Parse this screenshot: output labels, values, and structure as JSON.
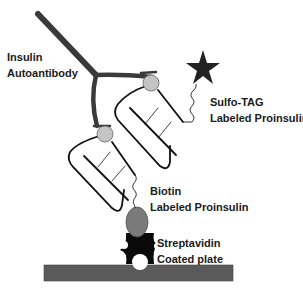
{
  "diagram": {
    "type": "assay schematic",
    "labels": {
      "antibody": {
        "line1": "Insulin",
        "line2": "Autoantibody"
      },
      "sulfotag": {
        "line1": "Sulfo-TAG",
        "line2": "Labeled Proinsulin"
      },
      "biotin": {
        "line1": "Biotin",
        "line2": "Labeled Proinsulin"
      },
      "streptavidin": {
        "line1": "Streptavidin",
        "line2": "Coated plate"
      }
    },
    "components": [
      {
        "id": "insulin-autoantibody",
        "shape": "Y-shape",
        "color": "#3a3a3a"
      },
      {
        "id": "sulfotag-proinsulin",
        "shape": "hairpin loop",
        "tag": "star",
        "color": "#222222"
      },
      {
        "id": "biotin-proinsulin",
        "shape": "hairpin loop",
        "tag": "oval",
        "color": "#777777"
      },
      {
        "id": "streptavidin",
        "shape": "cross",
        "color": "#0a0a0a"
      },
      {
        "id": "plate",
        "shape": "rectangle",
        "color": "#5a5a5a"
      }
    ],
    "colors": {
      "antibody": "#3a3a3a",
      "epitope_circle": "#c4c4c4",
      "star": "#222222",
      "biotin": "#7a7a7a",
      "streptavidin": "#0a0a0a",
      "plate": "#5a5a5a"
    }
  }
}
